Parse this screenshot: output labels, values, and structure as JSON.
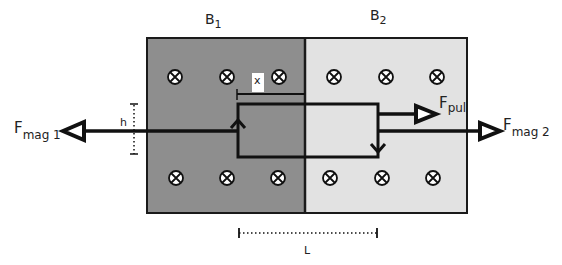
{
  "diagram": {
    "regions": [
      {
        "id": "B1",
        "label": "B",
        "subscript": "1",
        "fill": "#8e8e8e"
      },
      {
        "id": "B2",
        "label": "B",
        "subscript": "2",
        "fill": "#e2e2e2"
      }
    ],
    "field_symbol": "into-page-icon",
    "forces": {
      "fmag1": {
        "label": "F",
        "subscript": "mag 1"
      },
      "fmag2": {
        "label": "F",
        "subscript": "mag 2"
      },
      "fpul": {
        "label": "F",
        "subscript": "pul"
      }
    },
    "dimensions": {
      "x": "x",
      "h": "h",
      "L": "L"
    },
    "colors": {
      "outline": "#1a1a1a",
      "left_region": "#8e8e8e",
      "right_region": "#e2e2e2",
      "background": "#ffffff"
    }
  }
}
